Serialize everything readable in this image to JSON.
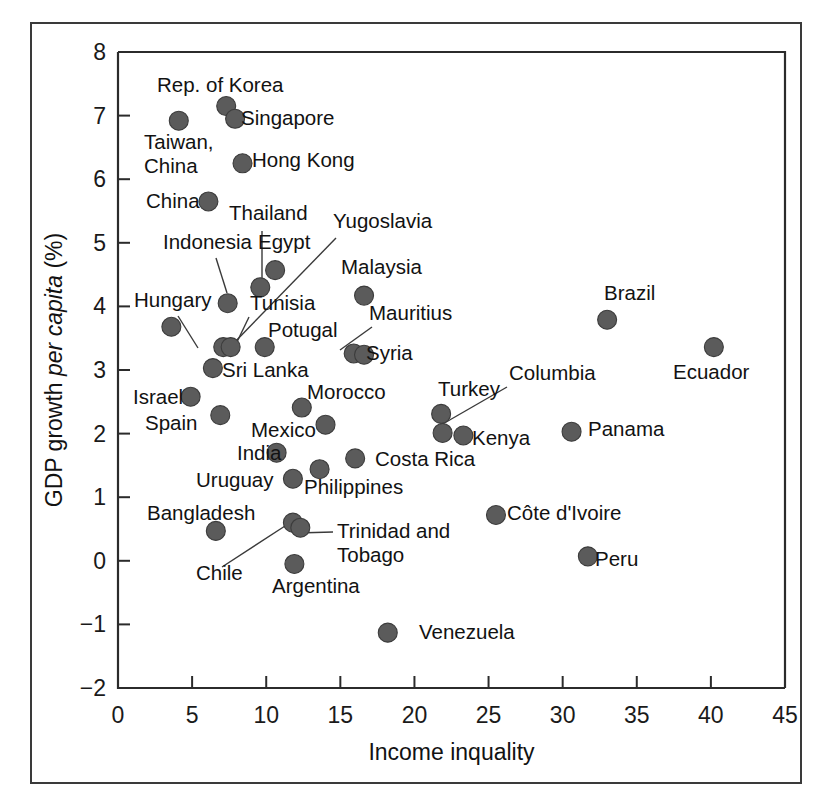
{
  "chart_data": {
    "type": "scatter",
    "title": "",
    "xlabel": "Income inquality",
    "ylabel_parts": [
      "GDP growth ",
      "per capita",
      " (%)"
    ],
    "ylabel": "GDP growth per capita (%)",
    "xlim": [
      0,
      45
    ],
    "ylim": [
      -2,
      8
    ],
    "xticks": [
      0,
      5,
      10,
      15,
      20,
      25,
      30,
      35,
      40,
      45
    ],
    "yticks": [
      -2,
      -1,
      0,
      1,
      2,
      3,
      4,
      5,
      6,
      7,
      8
    ],
    "xtick_labels": [
      "0",
      "5",
      "10",
      "15",
      "20",
      "25",
      "30",
      "35",
      "40",
      "45"
    ],
    "ytick_labels": [
      "−2",
      "−1",
      "0",
      "1",
      "2",
      "3",
      "4",
      "5",
      "6",
      "7",
      "8"
    ],
    "grid": false,
    "legend": "none",
    "marker_color": "#5b5b5b",
    "points": [
      {
        "name": "Rep. of Korea",
        "x": 7.3,
        "y": 7.15,
        "label": "Rep. of Korea",
        "lx": 157,
        "ly": 92,
        "anchor": "start",
        "leader": null
      },
      {
        "name": "Singapore",
        "x": 7.9,
        "y": 6.95,
        "label": "Singapore",
        "lx": 241,
        "ly": 125,
        "anchor": "start",
        "leader": null
      },
      {
        "name": "Taiwan, China",
        "x": 4.1,
        "y": 6.92,
        "label": "Taiwan,|China",
        "lx": 144,
        "ly": 149,
        "anchor": "start",
        "leader": null
      },
      {
        "name": "Hong Kong",
        "x": 8.4,
        "y": 6.25,
        "label": "Hong Kong",
        "lx": 252,
        "ly": 167,
        "anchor": "start",
        "leader": null
      },
      {
        "name": "China",
        "x": 6.1,
        "y": 5.65,
        "label": "China",
        "lx": 146,
        "ly": 208,
        "anchor": "start",
        "leader": null
      },
      {
        "name": "Thailand",
        "x": 9.6,
        "y": 4.3,
        "label": "Thailand",
        "lx": 229,
        "ly": 220,
        "anchor": "start",
        "leader": [
          262,
          231,
          262,
          290
        ]
      },
      {
        "name": "Yugoslavia",
        "x": 7.1,
        "y": 3.36,
        "label": "Yugoslavia",
        "lx": 333,
        "ly": 228,
        "anchor": "start",
        "leader": [
          336,
          238,
          231,
          346
        ]
      },
      {
        "name": "Indonesia",
        "x": 7.4,
        "y": 4.05,
        "label": "Indonesia",
        "lx": 163,
        "ly": 249,
        "anchor": "start",
        "leader": [
          216,
          258,
          227,
          293
        ]
      },
      {
        "name": "Egypt",
        "x": 10.6,
        "y": 4.57,
        "label": "Egypt",
        "lx": 258,
        "ly": 249,
        "anchor": "start",
        "leader": null
      },
      {
        "name": "Malaysia",
        "x": 16.6,
        "y": 4.17,
        "label": "Malaysia",
        "lx": 341,
        "ly": 274,
        "anchor": "start",
        "leader": null
      },
      {
        "name": "Hungary",
        "x": 3.6,
        "y": 3.68,
        "label": "Hungary",
        "lx": 134,
        "ly": 307,
        "anchor": "start",
        "leader": [
          178,
          316,
          198,
          348
        ]
      },
      {
        "name": "Brazil",
        "x": 33.0,
        "y": 3.79,
        "label": "Brazil",
        "lx": 604,
        "ly": 300,
        "anchor": "start",
        "leader": null
      },
      {
        "name": "Tunisia",
        "x": 7.6,
        "y": 3.36,
        "label": "Tunisia",
        "lx": 250,
        "ly": 310,
        "anchor": "start",
        "leader": [
          249,
          317,
          236,
          344
        ]
      },
      {
        "name": "Mauritius",
        "x": 15.9,
        "y": 3.26,
        "label": "Mauritius",
        "lx": 369,
        "ly": 320,
        "anchor": "start",
        "leader": [
          372,
          327,
          340,
          350
        ]
      },
      {
        "name": "Potugal",
        "x": 9.9,
        "y": 3.36,
        "label": "Potugal",
        "lx": 268,
        "ly": 337,
        "anchor": "start",
        "leader": null
      },
      {
        "name": "Ecuador",
        "x": 40.2,
        "y": 3.36,
        "label": "Ecuador",
        "lx": 673,
        "ly": 379,
        "anchor": "start",
        "leader": null
      },
      {
        "name": "Syria",
        "x": 16.6,
        "y": 3.24,
        "label": "Syria",
        "lx": 366,
        "ly": 360,
        "anchor": "start",
        "leader": null
      },
      {
        "name": "Sri Lanka",
        "x": 6.4,
        "y": 3.03,
        "label": "Sri Lanka",
        "lx": 222,
        "ly": 377,
        "anchor": "start",
        "leader": null
      },
      {
        "name": "Israel",
        "x": 4.9,
        "y": 2.58,
        "label": "Israel",
        "lx": 133,
        "ly": 404,
        "anchor": "start",
        "leader": null
      },
      {
        "name": "Morocco",
        "x": 12.4,
        "y": 2.41,
        "label": "Morocco",
        "lx": 307,
        "ly": 399,
        "anchor": "start",
        "leader": null
      },
      {
        "name": "Turkey",
        "x": 21.8,
        "y": 2.31,
        "label": "Turkey",
        "lx": 438,
        "ly": 396,
        "anchor": "start",
        "leader": null
      },
      {
        "name": "Columbia",
        "x": 21.9,
        "y": 2.01,
        "label": "Columbia",
        "lx": 509,
        "ly": 380,
        "anchor": "start",
        "leader": [
          507,
          387,
          441,
          425
        ]
      },
      {
        "name": "Spain",
        "x": 6.9,
        "y": 2.29,
        "label": "Spain",
        "lx": 145,
        "ly": 430,
        "anchor": "start",
        "leader": null
      },
      {
        "name": "Mexico",
        "x": 14.0,
        "y": 2.14,
        "label": "Mexico",
        "lx": 251,
        "ly": 437,
        "anchor": "start",
        "leader": null
      },
      {
        "name": "Kenya",
        "x": 23.3,
        "y": 1.97,
        "label": "Kenya",
        "lx": 472,
        "ly": 445,
        "anchor": "start",
        "leader": null
      },
      {
        "name": "Panama",
        "x": 30.6,
        "y": 2.03,
        "label": "Panama",
        "lx": 588,
        "ly": 436,
        "anchor": "start",
        "leader": null
      },
      {
        "name": "India",
        "x": 10.7,
        "y": 1.7,
        "label": "India",
        "lx": 237,
        "ly": 460,
        "anchor": "start",
        "leader": null
      },
      {
        "name": "Costa Rica",
        "x": 16.0,
        "y": 1.61,
        "label": "Costa Rica",
        "lx": 375,
        "ly": 466,
        "anchor": "start",
        "leader": null
      },
      {
        "name": "Philippines",
        "x": 13.6,
        "y": 1.44,
        "label": "Philippines",
        "lx": 304,
        "ly": 494,
        "anchor": "start",
        "leader": null
      },
      {
        "name": "Uruguay",
        "x": 11.8,
        "y": 1.29,
        "label": "Uruguay",
        "lx": 196,
        "ly": 487,
        "anchor": "start",
        "leader": null
      },
      {
        "name": "Côte d'Ivoire",
        "x": 25.5,
        "y": 0.72,
        "label": "Côte d'Ivoire",
        "lx": 507,
        "ly": 520,
        "anchor": "start",
        "leader": null
      },
      {
        "name": "Bangladesh",
        "x": 6.6,
        "y": 0.47,
        "label": "Bangladesh",
        "lx": 147,
        "ly": 520,
        "anchor": "start",
        "leader": null
      },
      {
        "name": "Chile",
        "x": 11.8,
        "y": 0.6,
        "label": "Chile",
        "lx": 196,
        "ly": 580,
        "anchor": "start",
        "leader": [
          222,
          567,
          285,
          526
        ]
      },
      {
        "name": "Trinidad and Tobago",
        "x": 12.3,
        "y": 0.52,
        "label": "Trinidad and|Tobago",
        "lx": 337,
        "ly": 538,
        "anchor": "start",
        "leader": [
          333,
          532,
          297,
          533
        ]
      },
      {
        "name": "Peru",
        "x": 31.7,
        "y": 0.07,
        "label": "Peru",
        "lx": 595,
        "ly": 566,
        "anchor": "start",
        "leader": null
      },
      {
        "name": "Argentina",
        "x": 11.9,
        "y": -0.05,
        "label": "Argentina",
        "lx": 272,
        "ly": 593,
        "anchor": "start",
        "leader": null
      },
      {
        "name": "Venezuela",
        "x": 18.2,
        "y": -1.13,
        "label": "Venezuela",
        "lx": 419,
        "ly": 639,
        "anchor": "start",
        "leader": null
      }
    ]
  }
}
